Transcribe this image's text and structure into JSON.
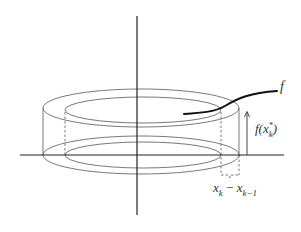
{
  "figure": {
    "labels": {
      "function": "f",
      "height_main": "f(x",
      "height_sup": "*",
      "height_sub": "k",
      "height_close": ")",
      "width_a": "x",
      "width_a_sub": "k",
      "width_minus": " − ",
      "width_b": "x",
      "width_b_sub": "k−1"
    },
    "colors": {
      "stroke": "#555555",
      "axis": "#222222",
      "curve": "#111111",
      "text": "#333333"
    }
  }
}
